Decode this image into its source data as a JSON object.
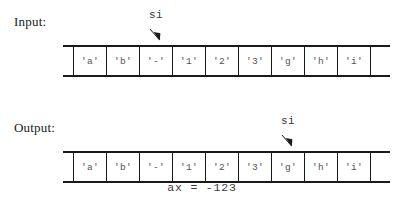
{
  "sections": {
    "input": {
      "label": "Input:",
      "pointer": {
        "name": "si",
        "target_index": 2
      },
      "tape": {
        "cells": [
          "'a'",
          "'b'",
          "'-'",
          "'1'",
          "'2'",
          "'3'",
          "'g'",
          "'h'",
          "'i'"
        ]
      }
    },
    "output": {
      "label": "Output:",
      "pointer": {
        "name": "si",
        "target_index": 6
      },
      "tape": {
        "cells": [
          "'a'",
          "'b'",
          "'-'",
          "'1'",
          "'2'",
          "'3'",
          "'g'",
          "'h'",
          "'i'"
        ]
      },
      "result": "ax = -123"
    }
  },
  "colors": {
    "ink": "#1a1a1a",
    "cell_text": "#555555",
    "mono_text": "#3a3a3a",
    "background": "#ffffff"
  }
}
